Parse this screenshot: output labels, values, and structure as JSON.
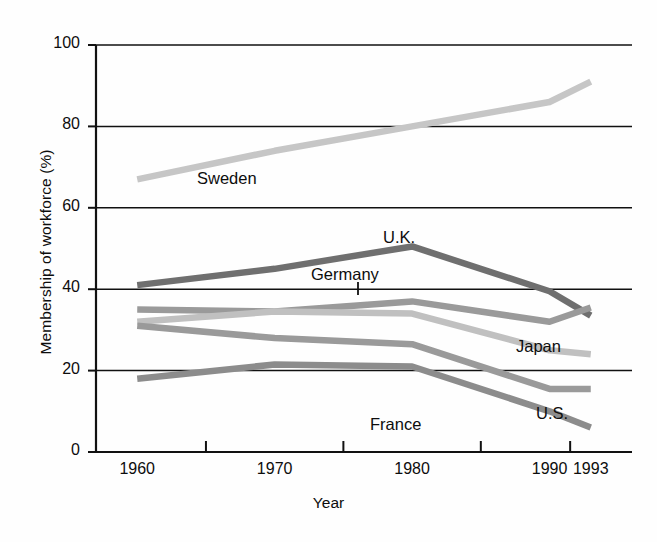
{
  "chart_data": {
    "type": "line",
    "title": "",
    "xlabel": "Year",
    "ylabel": "Membership of workforce (%)",
    "x": [
      1960,
      1970,
      1980,
      1990,
      1993
    ],
    "xtick_labels": [
      "1960",
      "1970",
      "1980",
      "1990",
      "1993"
    ],
    "ytick_labels": [
      "0",
      "20",
      "40",
      "60",
      "80",
      "100"
    ],
    "yticks": [
      0,
      20,
      40,
      60,
      80,
      100
    ],
    "ylim": [
      0,
      100
    ],
    "xlim": [
      1957,
      1996
    ],
    "grid": "horizontal",
    "legend": "inline-labels",
    "series": [
      {
        "name": "Sweden",
        "label": "Sweden",
        "color": "#c6c6c6",
        "values": [
          67,
          74,
          80,
          86,
          91
        ],
        "label_pos": {
          "x": 197,
          "y": 169
        }
      },
      {
        "name": "U.K.",
        "label": "U.K.",
        "color": "#6f6f6f",
        "values": [
          41,
          45,
          50.5,
          39.5,
          33.5
        ],
        "label_pos": {
          "x": 383,
          "y": 228
        }
      },
      {
        "name": "Germany",
        "label": "Germany",
        "color": "#9a9a9a",
        "values": [
          35,
          34.5,
          37,
          32,
          35.5
        ],
        "label_pos": {
          "x": 311,
          "y": 265
        }
      },
      {
        "name": "Japan",
        "label": "Japan",
        "color": "#c0c0c0",
        "values": [
          32,
          34.5,
          34,
          25,
          24
        ],
        "label_pos": {
          "x": 516,
          "y": 337
        }
      },
      {
        "name": "U.S.",
        "label": "U.S.",
        "color": "#9a9a9a",
        "values": [
          31,
          28,
          26.5,
          15.5,
          15.5
        ],
        "label_pos": {
          "x": 536,
          "y": 404
        }
      },
      {
        "name": "France",
        "label": "France",
        "color": "#8c8c8c",
        "values": [
          18,
          21.5,
          21,
          10,
          6
        ],
        "label_pos": {
          "x": 370,
          "y": 415
        }
      }
    ],
    "axis_color": "#111111",
    "grid_color": "#111111"
  }
}
